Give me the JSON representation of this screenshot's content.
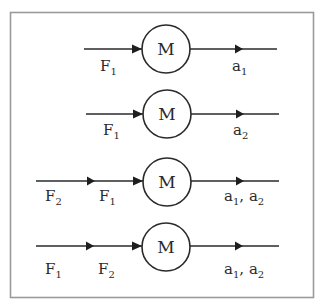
{
  "diagram": {
    "title": "",
    "mass_label": "M",
    "colors": {
      "stroke": "#2a2a2a",
      "frame": "#9a9a9a",
      "background": "#ffffff"
    },
    "rows": [
      {
        "inputs": [
          {
            "base": "F",
            "sub": "1"
          }
        ],
        "mass": "M",
        "output": [
          {
            "base": "a",
            "sub": "1"
          }
        ]
      },
      {
        "inputs": [
          {
            "base": "F",
            "sub": "1"
          }
        ],
        "mass": "M",
        "output": [
          {
            "base": "a",
            "sub": "2"
          }
        ]
      },
      {
        "inputs": [
          {
            "base": "F",
            "sub": "2"
          },
          {
            "base": "F",
            "sub": "1"
          }
        ],
        "mass": "M",
        "output": [
          {
            "base": "a",
            "sub": "1"
          },
          {
            "base": "a",
            "sub": "2"
          }
        ],
        "output_separator": ", "
      },
      {
        "inputs": [
          {
            "base": "F",
            "sub": "1"
          },
          {
            "base": "F",
            "sub": "2"
          }
        ],
        "mass": "M",
        "output": [
          {
            "base": "a",
            "sub": "1"
          },
          {
            "base": "a",
            "sub": "2"
          }
        ],
        "output_separator": ", "
      }
    ]
  }
}
